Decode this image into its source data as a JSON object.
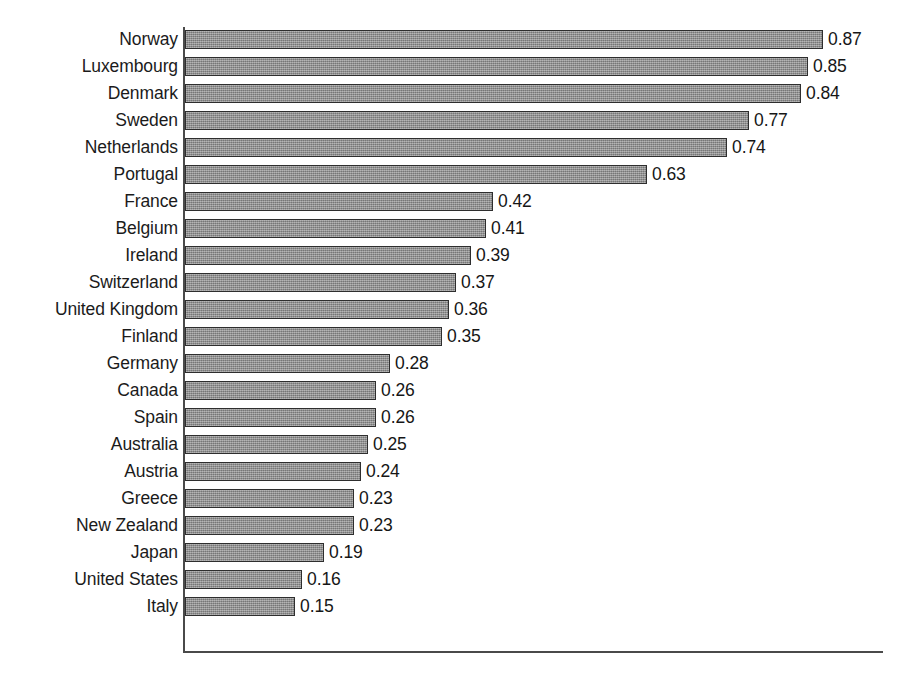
{
  "chart_data": {
    "type": "bar",
    "orientation": "horizontal",
    "title": "",
    "subtitle": "",
    "xlabel": "",
    "ylabel": "",
    "xlim": [
      0,
      0.95
    ],
    "grid": false,
    "legend": null,
    "value_labels": true,
    "value_format": "0.00",
    "categories": [
      "Norway",
      "Luxembourg",
      "Denmark",
      "Sweden",
      "Netherlands",
      "Portugal",
      "France",
      "Belgium",
      "Ireland",
      "Switzerland",
      "United Kingdom",
      "Finland",
      "Germany",
      "Canada",
      "Spain",
      "Australia",
      "Austria",
      "Greece",
      "New Zealand",
      "Japan",
      "United States",
      "Italy"
    ],
    "values": [
      0.87,
      0.85,
      0.84,
      0.77,
      0.74,
      0.63,
      0.42,
      0.41,
      0.39,
      0.37,
      0.36,
      0.35,
      0.28,
      0.26,
      0.26,
      0.25,
      0.24,
      0.23,
      0.23,
      0.19,
      0.16,
      0.15
    ],
    "value_label_texts": [
      "0.87",
      "0.85",
      "0.84",
      "0.77",
      "0.74",
      "0.63",
      "0.42",
      "0.41",
      "0.39",
      "0.37",
      "0.36",
      "0.35",
      "0.28",
      "0.26",
      "0.26",
      "0.25",
      "0.24",
      "0.23",
      "0.23",
      "0.19",
      "0.16",
      "0.15"
    ],
    "colors": {
      "bar_fill": "#8e8e8e",
      "bar_border": "#2e2e2e",
      "axis": "#4a4a4a",
      "text": "#1b1b1b",
      "background": "#ffffff"
    }
  },
  "layout": {
    "axis_origin_x": 184,
    "axis_top_y": 27,
    "axis_bottom_y": 652,
    "axis_right_x": 883,
    "px_per_unit": 733,
    "row_pitch": 27,
    "first_row_top": 30,
    "bar_height": 19,
    "label_right_edge": 178
  }
}
